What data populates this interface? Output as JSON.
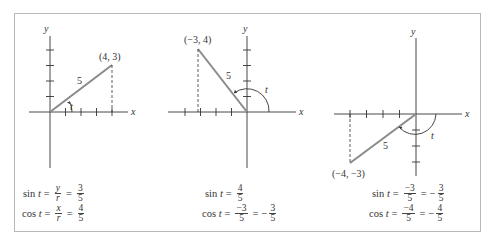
{
  "figure": {
    "panels": [
      {
        "point_label": "(4, 3)",
        "radius_label": "5",
        "angle_label": "t",
        "x_axis_label": "x",
        "y_axis_label": "y",
        "point": [
          4,
          3
        ],
        "sin": {
          "lhs": "sin",
          "var": "t",
          "steps": [
            {
              "num": "y",
              "den": "r",
              "italic": true
            },
            {
              "num": "3",
              "den": "5"
            }
          ],
          "sign_prefix": [
            "",
            ""
          ]
        },
        "cos": {
          "lhs": "cos",
          "var": "t",
          "steps": [
            {
              "num": "x",
              "den": "r",
              "italic": true
            },
            {
              "num": "4",
              "den": "5"
            }
          ],
          "sign_prefix": [
            "",
            ""
          ]
        }
      },
      {
        "point_label": "(−3, 4)",
        "radius_label": "5",
        "angle_label": "t",
        "x_axis_label": "x",
        "y_axis_label": "y",
        "point": [
          -3,
          4
        ],
        "sin": {
          "lhs": "sin",
          "var": "t",
          "steps": [
            {
              "num": "4",
              "den": "5"
            }
          ]
        },
        "cos": {
          "lhs": "cos",
          "var": "t",
          "steps": [
            {
              "num": "−3",
              "den": "5"
            },
            {
              "num": "3",
              "den": "5",
              "neg": true
            }
          ]
        }
      },
      {
        "point_label": "(−4, −3)",
        "radius_label": "5",
        "angle_label": "t",
        "x_axis_label": "x",
        "y_axis_label": "y",
        "point": [
          -4,
          -3
        ],
        "sin": {
          "lhs": "sin",
          "var": "t",
          "steps": [
            {
              "num": "−3",
              "den": "5"
            },
            {
              "num": "3",
              "den": "5",
              "neg": true
            }
          ]
        },
        "cos": {
          "lhs": "cos",
          "var": "t",
          "steps": [
            {
              "num": "−4",
              "den": "5"
            },
            {
              "num": "4",
              "den": "5",
              "neg": true
            }
          ]
        }
      }
    ],
    "text": {
      "p1_sin": "sin t = y/r = 3/5",
      "p1_cos": "cos t = x/r = 4/5",
      "p2_sin": "sin t = 4/5",
      "p2_cos": "cos t = −3/5 = −3/5",
      "p3_sin": "sin t = −3/5 = −3/5",
      "p3_cos": "cos t = −4/5 = −4/5"
    },
    "symbols": {
      "eq": "=",
      "minus": "−",
      "sin": "sin",
      "cos": "cos",
      "t": "t",
      "x": "x",
      "y": "y",
      "r": "r",
      "n3": "3",
      "n4": "4",
      "n5": "5",
      "neg3": "−3",
      "neg4": "−4"
    },
    "colors": {
      "line": "#8a8a8a",
      "axis": "#333333",
      "frame": "#b8b8b8"
    }
  }
}
